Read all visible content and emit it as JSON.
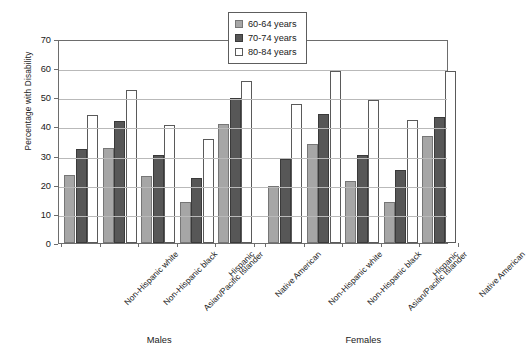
{
  "chart_data": {
    "type": "bar",
    "title": "",
    "xlabel": "",
    "ylabel": "Percentage with Disability",
    "ylim": [
      0,
      70
    ],
    "ytick_step": 10,
    "yticks": [
      0,
      10,
      20,
      30,
      40,
      50,
      60,
      70
    ],
    "grid": "horizontal",
    "legend_position": "top-center",
    "group_labels": [
      "Males",
      "Females"
    ],
    "categories": [
      "Non-Hispanic white",
      "Non-Hispanic black",
      "Asian/Pacific Islander",
      "Hispanic",
      "Native American"
    ],
    "series": [
      {
        "name": "60-64 years",
        "color": "#a6a6a6",
        "values_males": [
          23.5,
          32.7,
          23.1,
          14.1,
          40.9
        ],
        "values_females": [
          19.4,
          34.0,
          21.4,
          14.0,
          36.8
        ]
      },
      {
        "name": "70-74 years",
        "color": "#575757",
        "values_males": [
          32.3,
          41.8,
          30.3,
          22.2,
          49.9
        ],
        "values_females": [
          29.0,
          44.1,
          30.1,
          24.9,
          43.3
        ]
      },
      {
        "name": "80-84 years",
        "color": "#ffffff",
        "values_males": [
          44.0,
          52.6,
          40.5,
          35.8,
          55.7
        ],
        "values_females": [
          47.7,
          59.1,
          49.1,
          42.2,
          59.1
        ]
      }
    ]
  },
  "legend": {
    "items": [
      {
        "label": "60-64 years",
        "swatch": "light-gray"
      },
      {
        "label": "70-74 years",
        "swatch": "dark-gray"
      },
      {
        "label": "80-84 years",
        "swatch": "white"
      }
    ]
  },
  "axes": {
    "y_title": "Percentage with Disability",
    "y_labels": [
      "0",
      "10",
      "20",
      "30",
      "40",
      "50",
      "60",
      "70"
    ]
  },
  "sections": {
    "males_label": "Males",
    "females_label": "Females"
  }
}
